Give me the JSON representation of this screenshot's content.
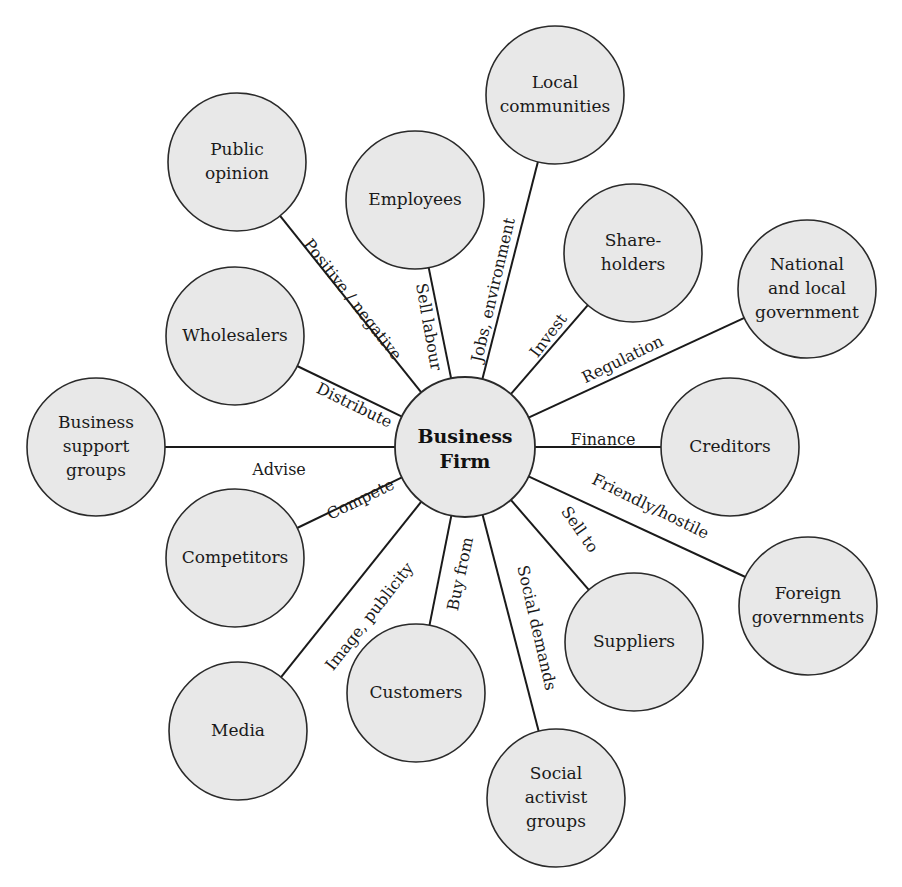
{
  "diagram": {
    "hub": {
      "label_line1": "Business",
      "label_line2": "Firm",
      "x": 465,
      "y": 447,
      "r": 70
    },
    "colors": {
      "fill": "#e8e8e8",
      "stroke": "#2a2a2a",
      "text": "#1a1a1a"
    },
    "stakeholders": [
      {
        "id": "public-opinion",
        "lines": [
          "Public",
          "opinion"
        ],
        "x": 237,
        "y": 162,
        "edge_label": "Positive / negative",
        "lx": 352,
        "ly": 300,
        "angle": 52
      },
      {
        "id": "employees",
        "lines": [
          "Employees"
        ],
        "x": 415,
        "y": 200,
        "edge_label": "Sell labour",
        "lx": 428,
        "ly": 327,
        "angle": 80
      },
      {
        "id": "local-communities",
        "lines": [
          "Local",
          "communities"
        ],
        "x": 555,
        "y": 95,
        "edge_label": "Jobs, environment",
        "lx": 494,
        "ly": 290,
        "angle": -77
      },
      {
        "id": "shareholders",
        "lines": [
          "Share-",
          "holders"
        ],
        "x": 633,
        "y": 253,
        "edge_label": "Invest",
        "lx": 549,
        "ly": 336,
        "angle": -53
      },
      {
        "id": "national-local-government",
        "lines": [
          "National",
          "and local",
          "government"
        ],
        "x": 807,
        "y": 289,
        "edge_label": "Regulation",
        "lx": 623,
        "ly": 360,
        "angle": -26
      },
      {
        "id": "creditors",
        "lines": [
          "Creditors"
        ],
        "x": 730,
        "y": 447,
        "edge_label": "Finance",
        "lx": 603,
        "ly": 440,
        "angle": 0
      },
      {
        "id": "foreign-governments",
        "lines": [
          "Foreign",
          "governments"
        ],
        "x": 808,
        "y": 606,
        "edge_label": "Friendly/hostile",
        "lx": 650,
        "ly": 507,
        "angle": 26
      },
      {
        "id": "suppliers",
        "lines": [
          "Suppliers"
        ],
        "x": 634,
        "y": 642,
        "edge_label": "Sell to",
        "lx": 579,
        "ly": 530,
        "angle": 55
      },
      {
        "id": "social-activist-groups",
        "lines": [
          "Social",
          "activist",
          "groups"
        ],
        "x": 556,
        "y": 798,
        "edge_label": "Social demands",
        "lx": 536,
        "ly": 628,
        "angle": 77
      },
      {
        "id": "customers",
        "lines": [
          "Customers"
        ],
        "x": 416,
        "y": 693,
        "edge_label": "Buy from",
        "lx": 461,
        "ly": 574,
        "angle": -78
      },
      {
        "id": "media",
        "lines": [
          "Media"
        ],
        "x": 238,
        "y": 731,
        "edge_label": "Image, publicity",
        "lx": 370,
        "ly": 617,
        "angle": -52
      },
      {
        "id": "competitors",
        "lines": [
          "Competitors"
        ],
        "x": 235,
        "y": 558,
        "edge_label": "Compete",
        "lx": 361,
        "ly": 500,
        "angle": -26
      },
      {
        "id": "business-support-groups",
        "lines": [
          "Business",
          "support",
          "groups"
        ],
        "x": 96,
        "y": 447,
        "edge_label": "Advise",
        "lx": 279,
        "ly": 470,
        "angle": 0
      },
      {
        "id": "wholesalers",
        "lines": [
          "Wholesalers"
        ],
        "x": 235,
        "y": 336,
        "edge_label": "Distribute",
        "lx": 354,
        "ly": 406,
        "angle": 26
      }
    ],
    "node_radius": 69
  }
}
